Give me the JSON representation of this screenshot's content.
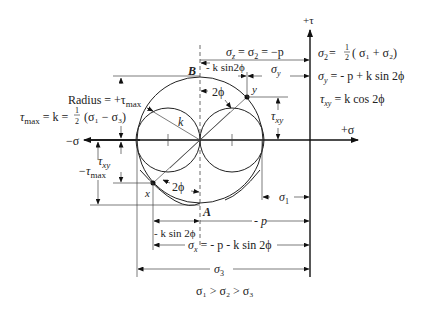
{
  "figure": {
    "axes": {
      "sigma_pos_label": "+σ",
      "sigma_neg_label": "−σ",
      "tau_pos_label": "+τ"
    },
    "points": {
      "B": "B",
      "A": "A",
      "x": "x",
      "y": "y"
    },
    "circle_labels": {
      "radius_label": "k",
      "radius_eq": "Radius = +τ",
      "radius_eq_sub": "max",
      "tau_max_eq_lhs": "τ",
      "tau_max_eq_sub": "max",
      "tau_max_eq_rhs": " = k = ",
      "half_num": "1",
      "half_den": "2",
      "tau_max_eq_tail": "(σ₁ − σ₃)"
    },
    "angles": {
      "upper": "2ϕ",
      "lower": "2ϕ"
    },
    "dimensions": {
      "top_sigma": "σz = σ2 = −p",
      "top_sigma_parts": {
        "s1": "σ",
        "sub1": "z",
        "mid": " = σ",
        "sub2": "2",
        "tail": " = −p"
      },
      "k_sin_top": "- k sin2ϕ",
      "sigma_y": "σ",
      "sigma_y_sub": "y",
      "tau_xy_right": "τ",
      "tau_xy_right_sub": "xy",
      "tau_xy_left": "τ",
      "tau_xy_left_sub": "xy",
      "neg_tau_max": "−τ",
      "neg_tau_max_sub": "max",
      "sigma_1": "σ",
      "sigma_1_sub": "1",
      "neg_p": "- p",
      "k_sin_bottom": "- k  sin 2ϕ",
      "sigma_x": "σ",
      "sigma_x_sub": "x",
      "sigma_x_rhs": " = - p - k sin 2ϕ",
      "sigma_3": "σ",
      "sigma_3_sub": "3"
    },
    "equations": {
      "eq1": {
        "lhs": "σ",
        "sub": "2",
        "mid": "= ",
        "num": "1",
        "den": "2",
        "rhs": "( σ₁ + σ₂)"
      },
      "eq2": {
        "lhs": "σ",
        "sub": "y",
        "rhs": " = - p + k sin 2ϕ"
      },
      "eq3": {
        "lhs": "τ",
        "sub": "xy",
        "rhs": " = k cos 2ϕ"
      }
    },
    "inequality": "σ₁ > σ₂ > σ₃"
  }
}
